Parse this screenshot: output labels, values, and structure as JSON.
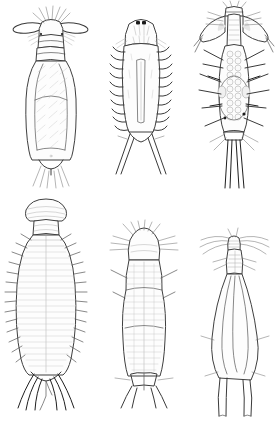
{
  "plate": {
    "title": "Plate of six crustacean larval line drawings",
    "background_color": "#ffffff",
    "ink_color": "#3a3a3a",
    "accent_color": "#1a1a1a",
    "layout": "3 columns x 2 rows",
    "caption": "",
    "figure_labels": [],
    "specimen_count": 6
  },
  "specimens": [
    {
      "id": "specimen-1",
      "position": "top-left",
      "name": "Elongate larva with paddle-shaped antennae",
      "head_feature": "two large oval paddle-like antennae, radiating bristles",
      "body_feature": "segmented elongate trunk with diagonal hatching",
      "tail_feature": "short forked caudal rami with fine setae",
      "eye_spots": 0,
      "lateral_setae_pairs": 4
    },
    {
      "id": "specimen-2",
      "position": "top-middle",
      "name": "Narrow spiny larva with central stylet",
      "head_feature": "rounded cephalon with two dark eye spots",
      "body_feature": "slender trunk with barbed lateral spine rows and long median stylet",
      "tail_feature": "wide V-shaped forked furca",
      "eye_spots": 2,
      "lateral_setae_pairs": 11
    },
    {
      "id": "specimen-3",
      "position": "top-right",
      "name": "Broad larva with winged cephalothorax",
      "head_feature": "wide shield with lateral wing-like expansions and plumose setae",
      "body_feature": "granular gut of paired vesicles with shaded ovaries",
      "tail_feature": "two long parallel caudal rami with dark tips",
      "eye_spots": 0,
      "lateral_setae_pairs": 6
    },
    {
      "id": "specimen-4",
      "position": "bottom-left",
      "name": "Large oval larva with dome head",
      "head_feature": "smooth rounded dome-shaped cephalon",
      "body_feature": "broad oval trunk with dense transverse striations",
      "tail_feature": "spreading fan of long curved caudal setae with dark tips",
      "eye_spots": 0,
      "lateral_setae_pairs": 13
    },
    {
      "id": "specimen-5",
      "position": "bottom-middle",
      "name": "Waisted larva with setal crown",
      "head_feature": "rounded cap bearing a fan of fine radiating setae",
      "body_feature": "waisted trunk with fine cross-hatched annulations",
      "tail_feature": "short forked furca with lateral setae",
      "eye_spots": 0,
      "lateral_setae_pairs": 2
    },
    {
      "id": "specimen-6",
      "position": "bottom-right",
      "name": "Slender sinuous larva with long antennae",
      "head_feature": "narrow ladder-segmented rostrum with long sweeping antennae",
      "body_feature": "slender sinuous outline, sparsely marked",
      "tail_feature": "two long slender parallel prongs",
      "eye_spots": 0,
      "lateral_setae_pairs": 2
    }
  ]
}
